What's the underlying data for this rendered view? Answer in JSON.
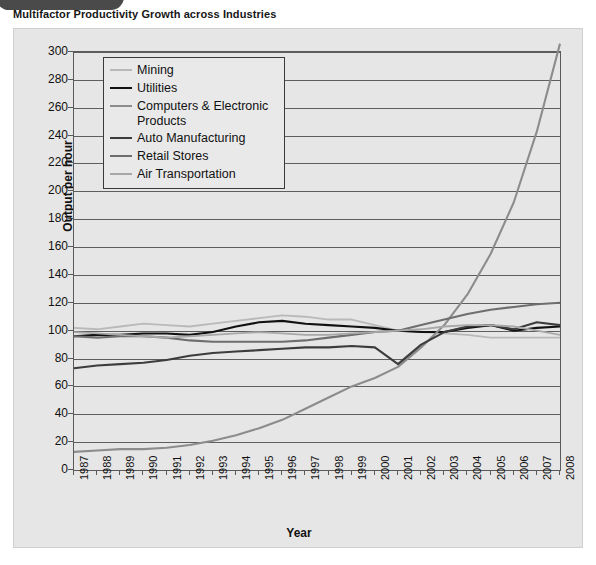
{
  "exhibit_tab": {
    "label": "EXHIBIT 14.1"
  },
  "title": "Multifactor Productivity Growth across Industries",
  "chart_data": {
    "type": "line",
    "title": "Multifactor Productivity Growth across Industries",
    "xlabel": "Year",
    "ylabel": "Output per hour",
    "xlim": [
      1987,
      2008
    ],
    "ylim": [
      0,
      300
    ],
    "yticks": [
      0,
      20,
      40,
      60,
      80,
      100,
      120,
      140,
      160,
      180,
      200,
      220,
      240,
      260,
      280,
      300
    ],
    "grid": true,
    "legend_position": "top-left-inside",
    "x": [
      1987,
      1988,
      1989,
      1990,
      1991,
      1992,
      1993,
      1994,
      1995,
      1996,
      1997,
      1998,
      1999,
      2000,
      2001,
      2002,
      2003,
      2004,
      2005,
      2006,
      2007,
      2008
    ],
    "categories": [
      "1987",
      "1988",
      "1989",
      "1990",
      "1991",
      "1992",
      "1993",
      "1994",
      "1995",
      "1996",
      "1997",
      "1998",
      "1999",
      "2000",
      "2001",
      "2002",
      "2003",
      "2004",
      "2005",
      "2006",
      "2007",
      "2008"
    ],
    "series": [
      {
        "name": "Mining",
        "color": "#b9b9b9",
        "width": 1.8,
        "values": [
          102,
          101,
          103,
          105,
          104,
          103,
          105,
          107,
          109,
          111,
          110,
          108,
          108,
          104,
          100,
          99,
          98,
          97,
          95,
          95,
          95,
          95
        ]
      },
      {
        "name": "Utilities",
        "color": "#111111",
        "width": 2.1,
        "values": [
          96,
          97,
          97,
          98,
          98,
          97,
          99,
          103,
          106,
          107,
          105,
          104,
          103,
          102,
          100,
          99,
          99,
          102,
          104,
          100,
          102,
          103
        ]
      },
      {
        "name": "Computers & Electronic Products",
        "color": "#8c8c8c",
        "width": 2.1,
        "values": [
          13,
          14,
          15,
          15,
          16,
          18,
          21,
          25,
          30,
          36,
          44,
          52,
          60,
          66,
          74,
          88,
          104,
          126,
          155,
          192,
          243,
          307
        ]
      },
      {
        "name": "Auto Manufacturing",
        "color": "#3c3c3c",
        "width": 2.1,
        "values": [
          73,
          75,
          76,
          77,
          79,
          82,
          84,
          85,
          86,
          87,
          88,
          88,
          89,
          88,
          76,
          90,
          99,
          103,
          104,
          101,
          106,
          104
        ]
      },
      {
        "name": "Retail Stores",
        "color": "#6e6e6e",
        "width": 2.1,
        "values": [
          96,
          95,
          96,
          96,
          95,
          93,
          92,
          92,
          92,
          92,
          93,
          95,
          97,
          99,
          100,
          104,
          108,
          112,
          115,
          117,
          119,
          120
        ]
      },
      {
        "name": "Air Transportation",
        "color": "#a8a8a8",
        "width": 1.8,
        "values": [
          99,
          98,
          97,
          96,
          95,
          96,
          97,
          98,
          99,
          98,
          97,
          97,
          98,
          99,
          100,
          101,
          103,
          104,
          104,
          103,
          100,
          97
        ]
      }
    ]
  }
}
